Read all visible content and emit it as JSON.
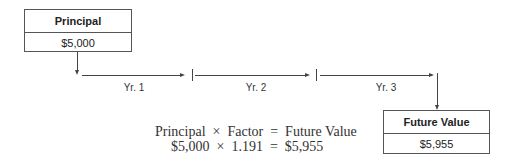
{
  "principal_box": {
    "title": "Principal",
    "value": "$5,000"
  },
  "future_value_box": {
    "title": "Future Value",
    "value": "$5,955"
  },
  "timeline": {
    "periods": [
      {
        "label": "Yr. 1"
      },
      {
        "label": "Yr. 2"
      },
      {
        "label": "Yr. 3"
      }
    ]
  },
  "formula": {
    "line1": "Principal  ×  Factor  =  Future Value",
    "line2": "$5,000  ×  1.191  =  $5,955"
  },
  "colors": {
    "line": "#444444",
    "border": "#555555",
    "text": "#222222"
  }
}
